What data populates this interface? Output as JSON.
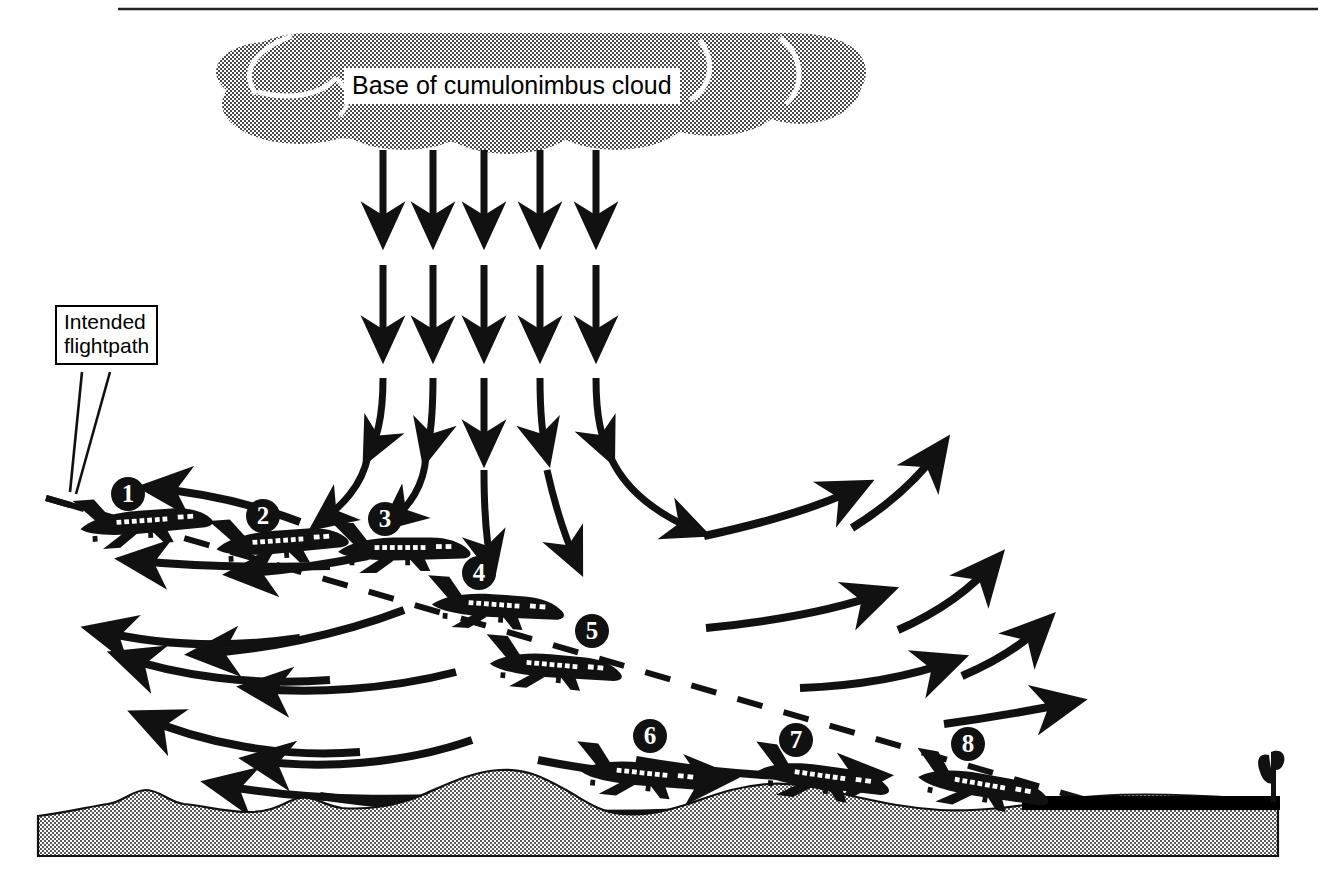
{
  "diagram": {
    "type": "aviation-weather-schematic",
    "colors": {
      "ink": "#000000",
      "cloud_fill": "#808080",
      "ground_fill": "#8a8a8a",
      "background": "#ffffff",
      "runway": "#000000"
    }
  },
  "labels": {
    "cloud": "Base of cumulonimbus cloud",
    "flightpath_line1": "Intended",
    "flightpath_line2": "flightpath"
  },
  "aircraft": [
    {
      "number": "1",
      "x": 126,
      "y": 494,
      "plane_x": 72,
      "plane_y": 492,
      "scale": 1.0,
      "rot": -4,
      "badge_dx": 54,
      "badge_dy": 2
    },
    {
      "number": "2",
      "x": 262,
      "y": 516,
      "plane_x": 208,
      "plane_y": 512,
      "scale": 1.0,
      "rot": -4,
      "badge_dx": 54,
      "badge_dy": 4
    },
    {
      "number": "3",
      "x": 383,
      "y": 519,
      "plane_x": 330,
      "plane_y": 519,
      "scale": 1.0,
      "rot": 0,
      "badge_dx": 53,
      "badge_dy": 0
    },
    {
      "number": "4",
      "x": 478,
      "y": 573,
      "plane_x": 420,
      "plane_y": 578,
      "scale": 1.0,
      "rot": 4,
      "badge_dx": 58,
      "badge_dy": -5
    },
    {
      "number": "5",
      "x": 592,
      "y": 631,
      "plane_x": 478,
      "plane_y": 640,
      "scale": 1.0,
      "rot": 5,
      "badge_dx": 114,
      "badge_dy": -9
    },
    {
      "number": "6",
      "x": 650,
      "y": 736,
      "plane_x": 572,
      "plane_y": 747,
      "scale": 1.0,
      "rot": 6,
      "badge_dx": 78,
      "badge_dy": -11
    },
    {
      "number": "7",
      "x": 795,
      "y": 740,
      "plane_x": 750,
      "plane_y": 749,
      "scale": 1.0,
      "rot": 8,
      "badge_dx": 45,
      "badge_dy": -9
    },
    {
      "number": "8",
      "x": 968,
      "y": 744,
      "plane_x": 905,
      "plane_y": 758,
      "scale": 1.0,
      "rot": 10,
      "badge_dx": 63,
      "badge_dy": -14
    }
  ],
  "downdraft": {
    "columns_x": [
      383,
      433,
      484,
      540,
      596
    ],
    "rows": [
      {
        "y_start": 150,
        "y_end": 243
      },
      {
        "y_start": 265,
        "y_end": 358
      },
      {
        "y_start": 378,
        "y_end": 462
      }
    ],
    "count_columns": 5,
    "count_rows": 3
  },
  "outflow": {
    "left_direction": "leftward-fanning headwind outflow",
    "right_direction": "rightward-rising tailwind outflow"
  },
  "ground": {
    "runway_label": "runway",
    "windsock_label": "windsock"
  }
}
